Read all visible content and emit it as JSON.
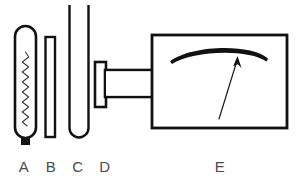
{
  "figure": {
    "background_color": "#ffffff",
    "line_color": "#111111",
    "label_color": "#4b4b4b",
    "width": 297,
    "height": 178,
    "parts": [
      {
        "id": "A",
        "label": "A",
        "name": "capsule-with-coil",
        "description": "rounded capsule containing a wavy coil with a small black stub at the bottom",
        "label_x": 24,
        "label_y": 172
      },
      {
        "id": "B",
        "label": "B",
        "name": "narrow-straight-tube",
        "description": "thin straight rectangular tube",
        "label_x": 51,
        "label_y": 172
      },
      {
        "id": "C",
        "label": "C",
        "name": "tall-u-tube",
        "description": "tall open-topped tube with rounded bottom",
        "label_x": 78,
        "label_y": 172
      },
      {
        "id": "D",
        "label": "D",
        "name": "plunger-shaft",
        "description": "T-shaped plunger with a horizontal shaft entering the instrument box",
        "label_x": 105,
        "label_y": 172
      },
      {
        "id": "E",
        "label": "E",
        "name": "meter-box",
        "description": "rectangular instrument box with a curved scale arc and a pointer needle",
        "label_x": 220,
        "label_y": 172
      }
    ]
  }
}
